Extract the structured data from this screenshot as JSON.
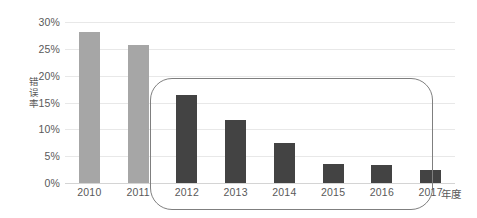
{
  "chart_data": {
    "type": "bar",
    "title": "",
    "subtitle": "",
    "xlabel": "年度",
    "ylabel": "错误率",
    "categories": [
      "2010",
      "2011",
      "2012",
      "2013",
      "2014",
      "2015",
      "2016",
      "2017"
    ],
    "values": [
      28.2,
      25.8,
      16.4,
      11.7,
      7.4,
      3.6,
      3.4,
      2.5
    ],
    "series": [
      {
        "name": "错误率",
        "values": [
          28.2,
          25.8,
          16.4,
          11.7,
          7.4,
          3.6,
          3.4,
          2.5
        ]
      }
    ],
    "bar_colors": [
      "#a6a6a6",
      "#a6a6a6",
      "#434343",
      "#434343",
      "#434343",
      "#434343",
      "#434343",
      "#434343"
    ],
    "ylim": [
      0,
      30
    ],
    "yticks": [
      0,
      5,
      10,
      15,
      20,
      25,
      30
    ],
    "ytick_labels": [
      "0%",
      "5%",
      "10%",
      "15%",
      "20%",
      "25%",
      "30%"
    ],
    "grid": true,
    "grid_color": "#e8e8e8",
    "legend": false,
    "legend_position": "none",
    "annotations": [
      {
        "kind": "rounded-rectangle",
        "covers": [
          "2012",
          "2013",
          "2014",
          "2015",
          "2016",
          "2017"
        ],
        "color": "#7f7f7f"
      }
    ]
  },
  "axis": {
    "y_title_chars": [
      "错",
      "误",
      "率"
    ],
    "x_title": "年度"
  },
  "colors": {
    "light_bar": "#a6a6a6",
    "dark_bar": "#434343",
    "gridline": "#e8e8e8",
    "baseline": "#d4d4d4",
    "annotation_stroke": "#7f7f7f",
    "tick_text": "#595959",
    "background": "#ffffff"
  }
}
